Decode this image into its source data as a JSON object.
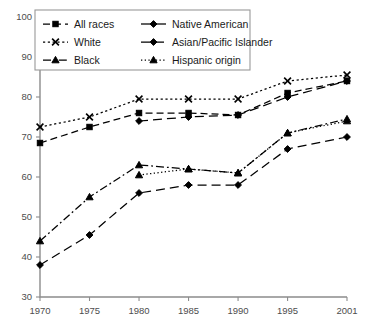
{
  "chart_data": {
    "type": "line",
    "title": "",
    "subtitle": "",
    "xlabel": "",
    "ylabel": "",
    "x": [
      1970,
      1975,
      1980,
      1985,
      1990,
      1995,
      2001
    ],
    "xtick_labels": [
      "1970",
      "1975",
      "1980",
      "1985",
      "1990",
      "1995",
      "2001"
    ],
    "ytick_labels": [
      "30",
      "40",
      "50",
      "60",
      "70",
      "80",
      "90",
      "100"
    ],
    "yticks": [
      30,
      40,
      50,
      60,
      70,
      80,
      90,
      100
    ],
    "xlim": [
      1970,
      2001
    ],
    "ylim": [
      30,
      100
    ],
    "grid": false,
    "legend_position": "top-left",
    "series": [
      {
        "name": "All races",
        "marker": "square",
        "dash": "dashed",
        "x": [
          1970,
          1975,
          1980,
          1985,
          1990,
          1995,
          2001
        ],
        "values": [
          68.5,
          72.5,
          76.0,
          76.0,
          75.5,
          81.0,
          84.0
        ]
      },
      {
        "name": "White",
        "marker": "x",
        "dash": "dotted",
        "x": [
          1970,
          1975,
          1980,
          1985,
          1990,
          1995,
          2001
        ],
        "values": [
          72.5,
          75.0,
          79.5,
          79.5,
          79.5,
          84.0,
          85.5
        ]
      },
      {
        "name": "Black",
        "marker": "triangle",
        "dash": "dash-dot",
        "x": [
          1970,
          1975,
          1980,
          1985,
          1990,
          1995,
          2001
        ],
        "values": [
          44.0,
          55.0,
          63.0,
          62.0,
          61.0,
          71.0,
          74.5
        ]
      },
      {
        "name": "Native American",
        "marker": "diamond",
        "dash": "long-dash",
        "x": [
          1970,
          1975,
          1980,
          1985,
          1990,
          1995,
          2001
        ],
        "values": [
          38.0,
          45.5,
          56.0,
          58.0,
          58.0,
          67.0,
          70.0
        ]
      },
      {
        "name": "Asian/Pacific Islander",
        "marker": "diamond",
        "dash": "long-dash",
        "x": [
          1980,
          1985,
          1990,
          1995,
          2001
        ],
        "values": [
          74.0,
          75.0,
          75.5,
          80.0,
          84.0
        ]
      },
      {
        "name": "Hispanic origin",
        "marker": "triangle",
        "dash": "fine-dotted",
        "x": [
          1980,
          1985,
          1990,
          1995,
          2001
        ],
        "values": [
          60.5,
          62.0,
          61.0,
          71.0,
          74.0
        ]
      }
    ]
  },
  "legend": {
    "entries": [
      {
        "label": "All races",
        "marker": "square",
        "dash": "dashed"
      },
      {
        "label": "Native American",
        "marker": "diamond",
        "dash": "solid"
      },
      {
        "label": "White",
        "marker": "x",
        "dash": "dotted"
      },
      {
        "label": "Asian/Pacific Islander",
        "marker": "diamond",
        "dash": "long-dash"
      },
      {
        "label": "Black",
        "marker": "triangle",
        "dash": "dash-dot"
      },
      {
        "label": "Hispanic origin",
        "marker": "triangle",
        "dash": "fine-dotted"
      }
    ]
  },
  "colors": {
    "ink": "#000000",
    "axis": "#8c8c8c",
    "tick_text": "#4d4d4d",
    "legend_border": "#999999",
    "background": "#ffffff"
  }
}
